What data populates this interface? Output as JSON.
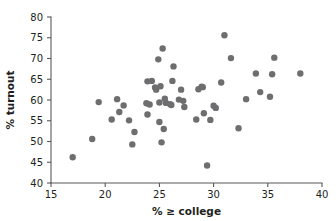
{
  "chart_data": {
    "type": "scatter",
    "title": "",
    "xlabel": "% ≥ college",
    "ylabel": "% turnout",
    "xlim": [
      15,
      40
    ],
    "ylim": [
      40,
      80
    ],
    "xticks": [
      15,
      20,
      25,
      30,
      35,
      40
    ],
    "yticks": [
      40,
      45,
      50,
      55,
      60,
      65,
      70,
      75,
      80
    ],
    "xtick_labels": [
      "15",
      "20",
      "25",
      "30",
      "35",
      "40"
    ],
    "ytick_labels": [
      "40",
      "45",
      "50",
      "55",
      "60",
      "65",
      "70",
      "75",
      "80"
    ],
    "grid": false,
    "legend": null,
    "marker": {
      "shape": "circle",
      "color": "#6e6e70",
      "size_px": 5.2
    },
    "axis_color": "#58595b",
    "background_color": "#ffffff",
    "n_points": 51,
    "points": [
      {
        "x": 17.0,
        "y": 46.2
      },
      {
        "x": 18.8,
        "y": 50.6
      },
      {
        "x": 19.4,
        "y": 59.5
      },
      {
        "x": 20.6,
        "y": 55.3
      },
      {
        "x": 21.1,
        "y": 60.2
      },
      {
        "x": 21.3,
        "y": 57.1
      },
      {
        "x": 21.7,
        "y": 58.7
      },
      {
        "x": 22.2,
        "y": 55.1
      },
      {
        "x": 22.5,
        "y": 49.3
      },
      {
        "x": 22.7,
        "y": 52.3
      },
      {
        "x": 23.8,
        "y": 59.2
      },
      {
        "x": 23.9,
        "y": 64.5
      },
      {
        "x": 23.9,
        "y": 56.5
      },
      {
        "x": 24.1,
        "y": 58.9
      },
      {
        "x": 24.3,
        "y": 64.6
      },
      {
        "x": 24.6,
        "y": 63.0
      },
      {
        "x": 24.7,
        "y": 62.5
      },
      {
        "x": 24.9,
        "y": 69.8
      },
      {
        "x": 25.0,
        "y": 59.4
      },
      {
        "x": 25.0,
        "y": 54.7
      },
      {
        "x": 25.1,
        "y": 63.3
      },
      {
        "x": 25.2,
        "y": 49.8
      },
      {
        "x": 25.3,
        "y": 72.4
      },
      {
        "x": 25.4,
        "y": 53.0
      },
      {
        "x": 25.5,
        "y": 60.3
      },
      {
        "x": 25.6,
        "y": 59.3
      },
      {
        "x": 26.0,
        "y": 59.0
      },
      {
        "x": 26.1,
        "y": 58.8
      },
      {
        "x": 26.2,
        "y": 64.6
      },
      {
        "x": 26.3,
        "y": 68.1
      },
      {
        "x": 26.8,
        "y": 60.1
      },
      {
        "x": 27.0,
        "y": 62.5
      },
      {
        "x": 27.2,
        "y": 59.8
      },
      {
        "x": 27.3,
        "y": 58.3
      },
      {
        "x": 28.4,
        "y": 55.3
      },
      {
        "x": 28.6,
        "y": 62.6
      },
      {
        "x": 28.9,
        "y": 63.2
      },
      {
        "x": 29.0,
        "y": 63.1
      },
      {
        "x": 29.1,
        "y": 56.8
      },
      {
        "x": 29.4,
        "y": 44.2
      },
      {
        "x": 29.7,
        "y": 55.2
      },
      {
        "x": 30.0,
        "y": 58.6
      },
      {
        "x": 30.2,
        "y": 58.1
      },
      {
        "x": 30.7,
        "y": 64.2
      },
      {
        "x": 31.0,
        "y": 75.6
      },
      {
        "x": 31.6,
        "y": 70.1
      },
      {
        "x": 32.3,
        "y": 53.2
      },
      {
        "x": 33.0,
        "y": 60.2
      },
      {
        "x": 33.9,
        "y": 66.4
      },
      {
        "x": 34.3,
        "y": 61.9
      },
      {
        "x": 35.2,
        "y": 60.8
      },
      {
        "x": 35.4,
        "y": 66.2
      },
      {
        "x": 35.6,
        "y": 70.2
      },
      {
        "x": 38.0,
        "y": 66.4
      }
    ]
  }
}
